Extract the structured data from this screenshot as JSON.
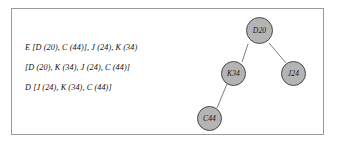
{
  "figure": {
    "derivation": {
      "lines": [
        "E [D (20), C (44)], J (24), K (34)",
        "[D (20), K (34), J (24), C (44)]",
        "D [J (24), K (34), C (44)]"
      ]
    },
    "tree": {
      "nodes": [
        {
          "id": "d20",
          "label": "D20"
        },
        {
          "id": "k34",
          "label": "K34"
        },
        {
          "id": "j24",
          "label": "J24"
        },
        {
          "id": "c44",
          "label": "C44"
        }
      ],
      "edges": [
        {
          "from": "d20",
          "to": "k34"
        },
        {
          "from": "d20",
          "to": "j24"
        },
        {
          "from": "k34",
          "to": "c44"
        }
      ]
    },
    "colors": {
      "node_fill": "#b4b4b4",
      "node_stroke": "#4a4a4a",
      "edge_stroke": "#6e6e6e",
      "frame_stroke": "#9a9a9a",
      "background": "#ffffff",
      "text": "#111111"
    }
  }
}
